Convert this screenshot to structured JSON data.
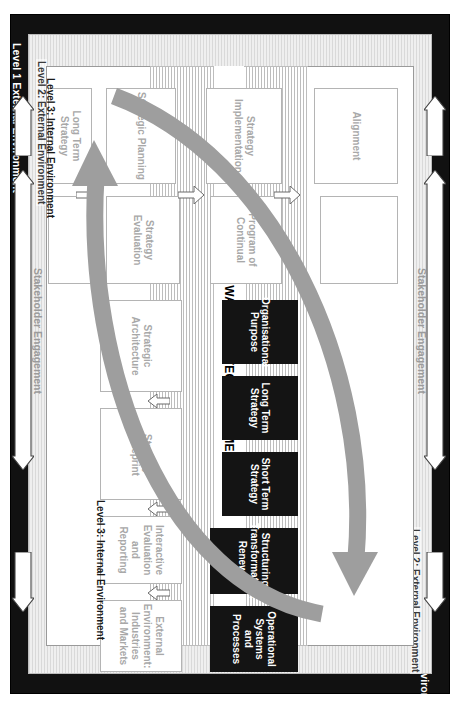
{
  "diagram": {
    "title": "THIRD WAVE STRATEGY ALIGNMENT",
    "levels": {
      "level1_top": "Level 1 External Environment",
      "level1_bottom": "Level 1 External Environment",
      "level2_top": "Level 2: External Environment",
      "level2_bottom": "Level 2: External Environment",
      "level3_left": "Level 3: Internal Environment",
      "level3_right": "Level 3: Internal Environment"
    },
    "rails": {
      "left": "Stakeholder Engagement",
      "right": "Stakeholder Engagement"
    },
    "core_boxes": [
      {
        "label": "Operational Systems and Processes"
      },
      {
        "label": "Structuring, Transformation, Renewal"
      },
      {
        "label": "Short Term Strategy"
      },
      {
        "label": "Long Term Strategy"
      },
      {
        "label": "Organisational Purpose"
      }
    ],
    "left_column": [
      {
        "label": "Alignment"
      },
      {
        "label": "Strategy Implementation"
      },
      {
        "label": "Strategic Planning"
      },
      {
        "label": "Long Term Strategy"
      }
    ],
    "inner_left_column": [
      {
        "label": ""
      },
      {
        "label": "Program of Continual"
      },
      {
        "label": "Strategy Evaluation"
      },
      {
        "label": ""
      }
    ],
    "inner_right_column": [
      {
        "label": "External Environment: Industries and Markets"
      },
      {
        "label": "Interactive Evaluation and Reporting"
      },
      {
        "label": "Strategy Blueprint"
      },
      {
        "label": "Strategic Architecture"
      }
    ],
    "colors": {
      "frame_level1": "#111111",
      "frame_level2": "#d9d9d9",
      "core_box": "#141414",
      "core_box_text": "#ffffff",
      "process_box_text": "#a8a8a8",
      "swoosh_arrow": "#9e9e9e"
    }
  }
}
